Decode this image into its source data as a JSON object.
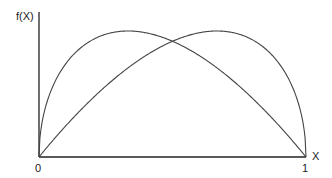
{
  "chart_data": {
    "type": "line",
    "title": "",
    "xlabel": "X",
    "ylabel": "f(X)",
    "x_ticks": [
      "0",
      "1"
    ],
    "xlim": [
      0,
      1
    ],
    "grid": false,
    "legend": null,
    "series": [
      {
        "name": "left-skewed density (peak near x≈0.35)",
        "x": [
          0,
          0.05,
          0.1,
          0.2,
          0.3,
          0.35,
          0.4,
          0.5,
          0.6,
          0.7,
          0.8,
          0.9,
          1.0
        ],
        "y": [
          0,
          0.55,
          0.74,
          0.93,
          0.99,
          1.0,
          0.98,
          0.92,
          0.8,
          0.65,
          0.46,
          0.25,
          0
        ]
      },
      {
        "name": "right-skewed density (peak near x≈0.65)",
        "x": [
          0,
          0.1,
          0.2,
          0.3,
          0.4,
          0.5,
          0.6,
          0.65,
          0.7,
          0.8,
          0.9,
          0.95,
          1.0
        ],
        "y": [
          0,
          0.25,
          0.46,
          0.65,
          0.8,
          0.92,
          0.98,
          1.0,
          0.99,
          0.93,
          0.74,
          0.55,
          0
        ]
      }
    ],
    "annotations": [
      "curves intersect at x = 0.5"
    ]
  },
  "labels": {
    "y_axis": "f(X)",
    "x_axis": "X",
    "x_min": "0",
    "x_max": "1"
  },
  "colors": {
    "axis": "#222222",
    "curve": "#444444"
  }
}
